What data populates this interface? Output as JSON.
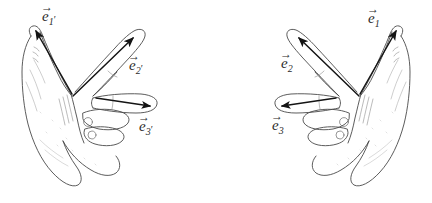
{
  "figure": {
    "background_color": "#ffffff",
    "ink_color": "#3a3a3a",
    "arrow_color": "#1a1a1a",
    "shading_color": "#9a9a9a"
  },
  "hands": [
    {
      "id": "left-hand",
      "name": "left-hand-triad",
      "handedness": "left",
      "description": "Left hand with thumb up-left, index finger up-right, middle finger pointing right",
      "vectors": [
        {
          "id": "e1p",
          "name": "vector-e1-prime",
          "base": "e",
          "subscript": "1",
          "prime": "′",
          "finger": "thumb",
          "direction": "up-left",
          "label_x": 42,
          "label_y": 8
        },
        {
          "id": "e2p",
          "name": "vector-e2-prime",
          "base": "e",
          "subscript": "2",
          "prime": "′",
          "finger": "index",
          "direction": "up-right",
          "label_x": 129,
          "label_y": 57
        },
        {
          "id": "e3p",
          "name": "vector-e3-prime",
          "base": "e",
          "subscript": "3",
          "prime": "′",
          "finger": "middle",
          "direction": "right",
          "label_x": 139,
          "label_y": 118
        }
      ]
    },
    {
      "id": "right-hand",
      "name": "right-hand-triad",
      "handedness": "right",
      "description": "Right hand with thumb up-right, index finger up-left, middle finger pointing left",
      "vectors": [
        {
          "id": "e1",
          "name": "vector-e1",
          "base": "e",
          "subscript": "1",
          "prime": "",
          "finger": "thumb",
          "direction": "up-right",
          "label_x": 368,
          "label_y": 10
        },
        {
          "id": "e2",
          "name": "vector-e2",
          "base": "e",
          "subscript": "2",
          "prime": "",
          "finger": "index",
          "direction": "up-left",
          "label_x": 281,
          "label_y": 55
        },
        {
          "id": "e3",
          "name": "vector-e3",
          "base": "e",
          "subscript": "3",
          "prime": "",
          "finger": "middle",
          "direction": "left",
          "label_x": 272,
          "label_y": 117
        }
      ]
    }
  ]
}
